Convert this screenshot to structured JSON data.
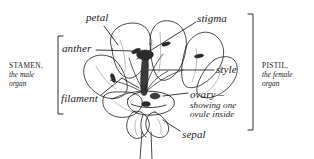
{
  "figure": {
    "background_color": "#ffffff",
    "ink_color": "#1a1a1a"
  },
  "labels": {
    "petal": "petal",
    "stigma": "stigma",
    "anther": "anther",
    "style": "style",
    "filament": "filament",
    "ovary_line1": "ovary –",
    "ovary_line2": "showing one",
    "ovary_line3": "ovule inside",
    "sepal": "sepal"
  },
  "groups": {
    "stamen": {
      "name": "STAMEN,",
      "line2": "the male",
      "line3": "organ"
    },
    "pistil": {
      "name": "PISTIL,",
      "line2": "the female",
      "line3": "organ"
    }
  }
}
